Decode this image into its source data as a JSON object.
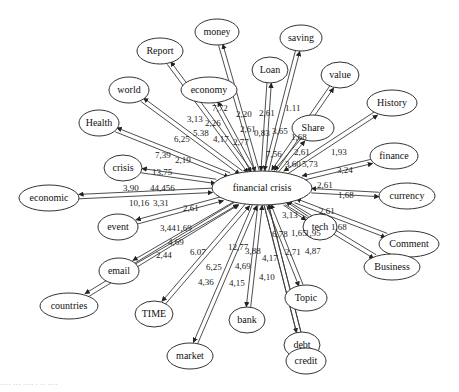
{
  "diagram": {
    "type": "directed-network",
    "center": {
      "id": "financial_crisis",
      "label": "financial crisis",
      "x": 262,
      "y": 188,
      "rx": 50,
      "ry": 17
    },
    "nodes": [
      {
        "id": "money",
        "label": "money",
        "x": 217,
        "y": 32,
        "rx": 22,
        "ry": 13
      },
      {
        "id": "Report",
        "label": "Report",
        "x": 160,
        "y": 51,
        "rx": 23,
        "ry": 13
      },
      {
        "id": "economy",
        "label": "economy",
        "x": 209,
        "y": 90,
        "rx": 28,
        "ry": 13
      },
      {
        "id": "Loan",
        "label": "Loan",
        "x": 270,
        "y": 70,
        "rx": 18,
        "ry": 13
      },
      {
        "id": "saving",
        "label": "saving",
        "x": 301,
        "y": 38,
        "rx": 21,
        "ry": 13
      },
      {
        "id": "value",
        "label": "value",
        "x": 340,
        "y": 75,
        "rx": 19,
        "ry": 13
      },
      {
        "id": "History",
        "label": "History",
        "x": 392,
        "y": 103,
        "rx": 25,
        "ry": 13
      },
      {
        "id": "Share",
        "label": "Share",
        "x": 313,
        "y": 128,
        "rx": 21,
        "ry": 13
      },
      {
        "id": "finance",
        "label": "finance",
        "x": 394,
        "y": 156,
        "rx": 24,
        "ry": 13
      },
      {
        "id": "currency",
        "label": "currency",
        "x": 407,
        "y": 196,
        "rx": 28,
        "ry": 13
      },
      {
        "id": "Comment",
        "label": "Comment",
        "x": 409,
        "y": 244,
        "rx": 30,
        "ry": 13
      },
      {
        "id": "tech",
        "label": "tech",
        "x": 320,
        "y": 227,
        "rx": 17,
        "ry": 13
      },
      {
        "id": "Business",
        "label": "Business",
        "x": 392,
        "y": 267,
        "rx": 28,
        "ry": 13
      },
      {
        "id": "Topic",
        "label": "Topic",
        "x": 306,
        "y": 298,
        "rx": 21,
        "ry": 13
      },
      {
        "id": "debt",
        "label": "debt",
        "x": 302,
        "y": 345,
        "rx": 18,
        "ry": 13
      },
      {
        "id": "credit",
        "label": "credit",
        "x": 306,
        "y": 361,
        "rx": 20,
        "ry": 13
      },
      {
        "id": "bank",
        "label": "bank",
        "x": 247,
        "y": 320,
        "rx": 18,
        "ry": 13
      },
      {
        "id": "market",
        "label": "market",
        "x": 190,
        "y": 356,
        "rx": 23,
        "ry": 13
      },
      {
        "id": "TIME",
        "label": "TIME",
        "x": 154,
        "y": 314,
        "rx": 19,
        "ry": 13
      },
      {
        "id": "countries",
        "label": "countries",
        "x": 69,
        "y": 306,
        "rx": 29,
        "ry": 13
      },
      {
        "id": "email",
        "label": "email",
        "x": 119,
        "y": 271,
        "rx": 20,
        "ry": 13
      },
      {
        "id": "event",
        "label": "event",
        "x": 118,
        "y": 227,
        "rx": 20,
        "ry": 13
      },
      {
        "id": "economic",
        "label": "economic",
        "x": 49,
        "y": 198,
        "rx": 30,
        "ry": 13
      },
      {
        "id": "crisis",
        "label": "crisis",
        "x": 123,
        "y": 168,
        "rx": 19,
        "ry": 13
      },
      {
        "id": "Health",
        "label": "Health",
        "x": 99,
        "y": 123,
        "rx": 20,
        "ry": 13
      },
      {
        "id": "world",
        "label": "world",
        "x": 129,
        "y": 90,
        "rx": 20,
        "ry": 13
      }
    ],
    "edge_labels": [
      {
        "text": "3,13",
        "x": 187,
        "y": 122
      },
      {
        "text": "2,26",
        "x": 205,
        "y": 126
      },
      {
        "text": "7,72",
        "x": 212,
        "y": 111
      },
      {
        "text": "2,20",
        "x": 236,
        "y": 117
      },
      {
        "text": "2,61",
        "x": 259,
        "y": 116
      },
      {
        "text": "1.11",
        "x": 285,
        "y": 111
      },
      {
        "text": "6,25",
        "x": 174,
        "y": 142
      },
      {
        "text": "5.38",
        "x": 193,
        "y": 136
      },
      {
        "text": "4,17",
        "x": 213,
        "y": 142
      },
      {
        "text": "2,77",
        "x": 233,
        "y": 145
      },
      {
        "text": "2,61",
        "x": 240,
        "y": 132
      },
      {
        "text": "0,83",
        "x": 254,
        "y": 136
      },
      {
        "text": "3,65",
        "x": 272,
        "y": 134
      },
      {
        "text": "1,68",
        "x": 291,
        "y": 140
      },
      {
        "text": "7,39",
        "x": 155,
        "y": 158
      },
      {
        "text": "2,19",
        "x": 175,
        "y": 163
      },
      {
        "text": "7,56",
        "x": 266,
        "y": 157
      },
      {
        "text": "2,61",
        "x": 294,
        "y": 155
      },
      {
        "text": "1,93",
        "x": 331,
        "y": 155
      },
      {
        "text": "3,60",
        "x": 285,
        "y": 167
      },
      {
        "text": "5,73",
        "x": 302,
        "y": 167
      },
      {
        "text": "3,24",
        "x": 337,
        "y": 173
      },
      {
        "text": "13,75",
        "x": 152,
        "y": 175
      },
      {
        "text": "3,90",
        "x": 123,
        "y": 191
      },
      {
        "text": "44,456",
        "x": 150,
        "y": 191
      },
      {
        "text": "2,61",
        "x": 317,
        "y": 188
      },
      {
        "text": "1,68",
        "x": 338,
        "y": 198
      },
      {
        "text": "10,16",
        "x": 129,
        "y": 206
      },
      {
        "text": "3,31",
        "x": 153,
        "y": 206
      },
      {
        "text": "2,61",
        "x": 183,
        "y": 211
      },
      {
        "text": "2,61",
        "x": 319,
        "y": 214
      },
      {
        "text": "3,13",
        "x": 282,
        "y": 218
      },
      {
        "text": "1,68",
        "x": 331,
        "y": 230
      },
      {
        "text": "3,44",
        "x": 160,
        "y": 231
      },
      {
        "text": "1,69",
        "x": 176,
        "y": 231
      },
      {
        "text": "1,65",
        "x": 291,
        "y": 236
      },
      {
        "text": "1,95",
        "x": 305,
        "y": 236
      },
      {
        "text": "6,78",
        "x": 272,
        "y": 237
      },
      {
        "text": "4,69",
        "x": 168,
        "y": 245
      },
      {
        "text": "6.07",
        "x": 190,
        "y": 255
      },
      {
        "text": "12,77",
        "x": 228,
        "y": 250
      },
      {
        "text": "3,88",
        "x": 245,
        "y": 254
      },
      {
        "text": "2,71",
        "x": 285,
        "y": 255
      },
      {
        "text": "4,87",
        "x": 305,
        "y": 254
      },
      {
        "text": "2,44",
        "x": 156,
        "y": 258
      },
      {
        "text": "4,17",
        "x": 262,
        "y": 261
      },
      {
        "text": "6,25",
        "x": 206,
        "y": 270
      },
      {
        "text": "4,69",
        "x": 235,
        "y": 269
      },
      {
        "text": "4,10",
        "x": 259,
        "y": 280
      },
      {
        "text": "4,36",
        "x": 198,
        "y": 285
      },
      {
        "text": "4,15",
        "x": 229,
        "y": 286
      }
    ],
    "caption": "···· ··· ···· · ·· ····"
  }
}
